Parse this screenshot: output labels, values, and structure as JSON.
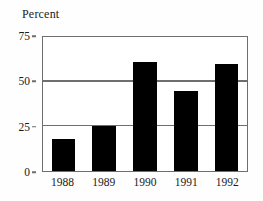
{
  "chart_data": {
    "type": "bar",
    "title": "Percent",
    "xlabel": "",
    "ylabel": "Percent",
    "categories": [
      "1988",
      "1989",
      "1990",
      "1991",
      "1992"
    ],
    "values": [
      18,
      25,
      61,
      45,
      60
    ],
    "ylim": [
      0,
      75
    ],
    "yticks": [
      0,
      25,
      50,
      75
    ],
    "ytick_labels": [
      "0",
      "25",
      "50",
      "75"
    ],
    "gridlines": true,
    "gridline_values": [
      25,
      50
    ],
    "legend": null,
    "legend_position": "none",
    "bar_color": "#000000",
    "grid_color": "#6e6e6e",
    "text_color": "#1a1a1a",
    "background_color": "#ffffff"
  }
}
